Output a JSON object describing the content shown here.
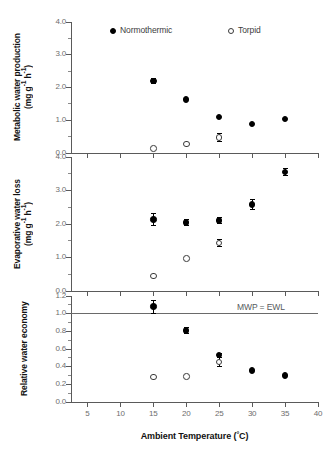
{
  "figure": {
    "xaxis_title": "Ambient Temperature (°C)",
    "degree_symbol": "°C",
    "legend": [
      {
        "label": "Normothermic",
        "marker": "filled-circle"
      },
      {
        "label": "Torpid",
        "marker": "open-circle"
      }
    ],
    "reference_label": "MWP = EWL"
  },
  "chart_data": [
    {
      "type": "scatter",
      "panel": "top",
      "title": "",
      "ylabel": "Metabolic water production (mg g⁻¹ h⁻¹)",
      "ylabel_line1": "Metabolic water production",
      "ylabel_line2": "(mg g⁻¹ h⁻¹)",
      "xlabel": "Ambient Temperature (°C)",
      "xlim": [
        2.5,
        40
      ],
      "ylim": [
        0.0,
        4.0
      ],
      "yticks": [
        0.0,
        1.0,
        2.0,
        3.0,
        4.0
      ],
      "ytick_labels": [
        "0.0",
        "1.0",
        "2.0",
        "3.0",
        "4.0"
      ],
      "xticks": [
        5,
        10,
        15,
        20,
        25,
        30,
        35,
        40
      ],
      "xtick_labels": [
        "5",
        "10",
        "15",
        "20",
        "25",
        "30",
        "35",
        "40"
      ],
      "grid": false,
      "legend_position": "top-inside",
      "series": [
        {
          "name": "Normothermic",
          "marker": "filled-circle",
          "x": [
            15,
            20,
            25,
            30,
            35
          ],
          "values": [
            2.2,
            1.63,
            1.1,
            0.89,
            1.04
          ],
          "errors": [
            0.1,
            0.0,
            0.0,
            0.0,
            0.0
          ]
        },
        {
          "name": "Torpid",
          "marker": "open-circle",
          "x": [
            15,
            20,
            25
          ],
          "values": [
            0.13,
            0.28,
            0.48
          ],
          "errors": [
            0.0,
            0.0,
            0.13
          ]
        }
      ]
    },
    {
      "type": "scatter",
      "panel": "middle",
      "title": "",
      "ylabel": "Evaporative water loss (mg g⁻¹ h⁻¹)",
      "ylabel_line1": "Evaporative water loss",
      "ylabel_line2": "(mg g⁻¹ h⁻¹)",
      "xlabel": "Ambient Temperature (°C)",
      "xlim": [
        2.5,
        40
      ],
      "ylim": [
        0.0,
        4.0
      ],
      "yticks": [
        0.0,
        1.0,
        2.0,
        3.0,
        4.0
      ],
      "ytick_labels": [
        "0.0",
        "1.0",
        "2.0",
        "3.0",
        "4.0"
      ],
      "xticks": [
        5,
        10,
        15,
        20,
        25,
        30,
        35,
        40
      ],
      "xtick_labels": [
        "5",
        "10",
        "15",
        "20",
        "25",
        "30",
        "35",
        "40"
      ],
      "grid": false,
      "series": [
        {
          "name": "Normothermic",
          "marker": "filled-circle",
          "x": [
            15,
            20,
            25,
            30,
            35
          ],
          "values": [
            2.14,
            2.05,
            2.1,
            2.58,
            3.55
          ],
          "errors": [
            0.2,
            0.11,
            0.11,
            0.17,
            0.11
          ]
        },
        {
          "name": "Torpid",
          "marker": "open-circle",
          "x": [
            15,
            20,
            25
          ],
          "values": [
            0.45,
            0.97,
            1.43
          ],
          "errors": [
            0.0,
            0.0,
            0.12
          ]
        }
      ]
    },
    {
      "type": "scatter",
      "panel": "bottom",
      "title": "",
      "ylabel": "Relative water economy",
      "xlabel": "Ambient Temperature (°C)",
      "xlim": [
        2.5,
        40
      ],
      "ylim": [
        0.0,
        1.2
      ],
      "yticks": [
        0.0,
        0.2,
        0.4,
        0.6,
        0.8,
        1.0,
        1.2
      ],
      "ytick_labels": [
        "0.0",
        "0.2",
        "0.4",
        "0.6",
        "0.8",
        "1.0",
        "1.2"
      ],
      "xticks": [
        5,
        10,
        15,
        20,
        25,
        30,
        35,
        40
      ],
      "xtick_labels": [
        "5",
        "10",
        "15",
        "20",
        "25",
        "30",
        "35",
        "40"
      ],
      "grid": false,
      "reference_line": {
        "y": 1.0,
        "label": "MWP = EWL"
      },
      "series": [
        {
          "name": "Normothermic",
          "marker": "filled-circle",
          "x": [
            15,
            20,
            25,
            30,
            35
          ],
          "values": [
            1.08,
            0.81,
            0.53,
            0.355,
            0.3
          ],
          "errors": [
            0.08,
            0.04,
            0.03,
            0.0,
            0.0
          ]
        },
        {
          "name": "Torpid",
          "marker": "open-circle",
          "x": [
            15,
            20,
            25
          ],
          "values": [
            0.285,
            0.29,
            0.455
          ],
          "errors": [
            0.0,
            0.0,
            0.06
          ]
        }
      ]
    }
  ]
}
